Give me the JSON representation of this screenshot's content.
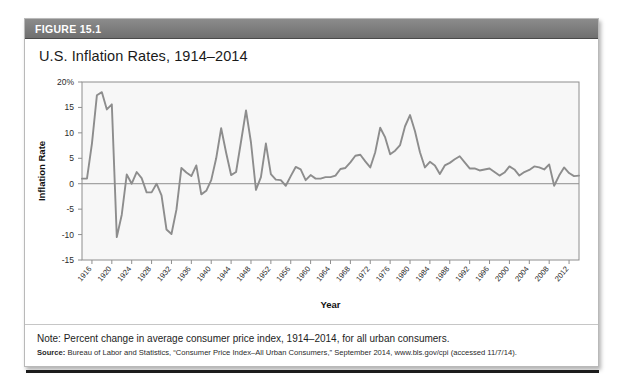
{
  "figure": {
    "number_label": "FIGURE 15.1",
    "title": "U.S. Inflation Rates, 1914–2014",
    "note": "Note: Percent change in average consumer price index, 1914–2014, for all urban consumers.",
    "source_label": "Source:",
    "source_text": " Bureau of Labor and Statistics, “Consumer Price Index–All Urban Consumers,” September 2014, www.bls.gov/cpi (accessed 11/7/14).",
    "accent_header_color": "#7c7c7c",
    "line_color": "#8d8d8d",
    "plot_bg_color": "#f7f7f7"
  },
  "chart_data": {
    "type": "line",
    "title": "U.S. Inflation Rates, 1914–2014",
    "xlabel": "Year",
    "ylabel": "Inflation Rate",
    "ylim": [
      -15,
      20
    ],
    "xlim": [
      1914,
      2014
    ],
    "grid": false,
    "legend": "none",
    "ytick_labels": [
      "20%",
      "15",
      "10",
      "5",
      "0",
      "-5",
      "-10",
      "-15"
    ],
    "ytick_values": [
      20,
      15,
      10,
      5,
      0,
      -5,
      -10,
      -15
    ],
    "xtick_labels": [
      "1916",
      "1920",
      "1924",
      "1928",
      "1932",
      "1936",
      "1940",
      "1944",
      "1948",
      "1952",
      "1956",
      "1960",
      "1964",
      "1968",
      "1972",
      "1976",
      "1980",
      "1984",
      "1988",
      "1992",
      "1996",
      "2000",
      "2004",
      "2008",
      "2012"
    ],
    "xtick_values": [
      1916,
      1920,
      1924,
      1928,
      1932,
      1936,
      1940,
      1944,
      1948,
      1952,
      1956,
      1960,
      1964,
      1968,
      1972,
      1976,
      1980,
      1984,
      1988,
      1992,
      1996,
      2000,
      2004,
      2008,
      2012
    ],
    "series": [
      {
        "name": "Inflation Rate",
        "x": [
          1914,
          1915,
          1916,
          1917,
          1918,
          1919,
          1920,
          1921,
          1922,
          1923,
          1924,
          1925,
          1926,
          1927,
          1928,
          1929,
          1930,
          1931,
          1932,
          1933,
          1934,
          1935,
          1936,
          1937,
          1938,
          1939,
          1940,
          1941,
          1942,
          1943,
          1944,
          1945,
          1946,
          1947,
          1948,
          1949,
          1950,
          1951,
          1952,
          1953,
          1954,
          1955,
          1956,
          1957,
          1958,
          1959,
          1960,
          1961,
          1962,
          1963,
          1964,
          1965,
          1966,
          1967,
          1968,
          1969,
          1970,
          1971,
          1972,
          1973,
          1974,
          1975,
          1976,
          1977,
          1978,
          1979,
          1980,
          1981,
          1982,
          1983,
          1984,
          1985,
          1986,
          1987,
          1988,
          1989,
          1990,
          1991,
          1992,
          1993,
          1994,
          1995,
          1996,
          1997,
          1998,
          1999,
          2000,
          2001,
          2002,
          2003,
          2004,
          2005,
          2006,
          2007,
          2008,
          2009,
          2010,
          2011,
          2012,
          2013,
          2014
        ],
        "y": [
          1.0,
          1.0,
          7.9,
          17.4,
          18.0,
          14.6,
          15.6,
          -10.5,
          -6.1,
          1.8,
          0.0,
          2.3,
          1.1,
          -1.7,
          -1.7,
          0.0,
          -2.3,
          -9.0,
          -9.9,
          -5.1,
          3.1,
          2.2,
          1.5,
          3.6,
          -2.1,
          -1.4,
          0.7,
          5.0,
          10.9,
          6.1,
          1.7,
          2.3,
          8.3,
          14.4,
          8.1,
          -1.2,
          1.3,
          7.9,
          1.9,
          0.8,
          0.7,
          -0.4,
          1.5,
          3.3,
          2.8,
          0.7,
          1.7,
          1.0,
          1.0,
          1.3,
          1.3,
          1.6,
          2.9,
          3.1,
          4.2,
          5.5,
          5.7,
          4.4,
          3.2,
          6.2,
          11.0,
          9.1,
          5.8,
          6.5,
          7.6,
          11.3,
          13.5,
          10.3,
          6.2,
          3.2,
          4.3,
          3.6,
          1.9,
          3.6,
          4.1,
          4.8,
          5.4,
          4.2,
          3.0,
          3.0,
          2.6,
          2.8,
          3.0,
          2.3,
          1.6,
          2.2,
          3.4,
          2.8,
          1.6,
          2.3,
          2.7,
          3.4,
          3.2,
          2.8,
          3.8,
          -0.4,
          1.6,
          3.2,
          2.1,
          1.5,
          1.6
        ]
      }
    ]
  }
}
